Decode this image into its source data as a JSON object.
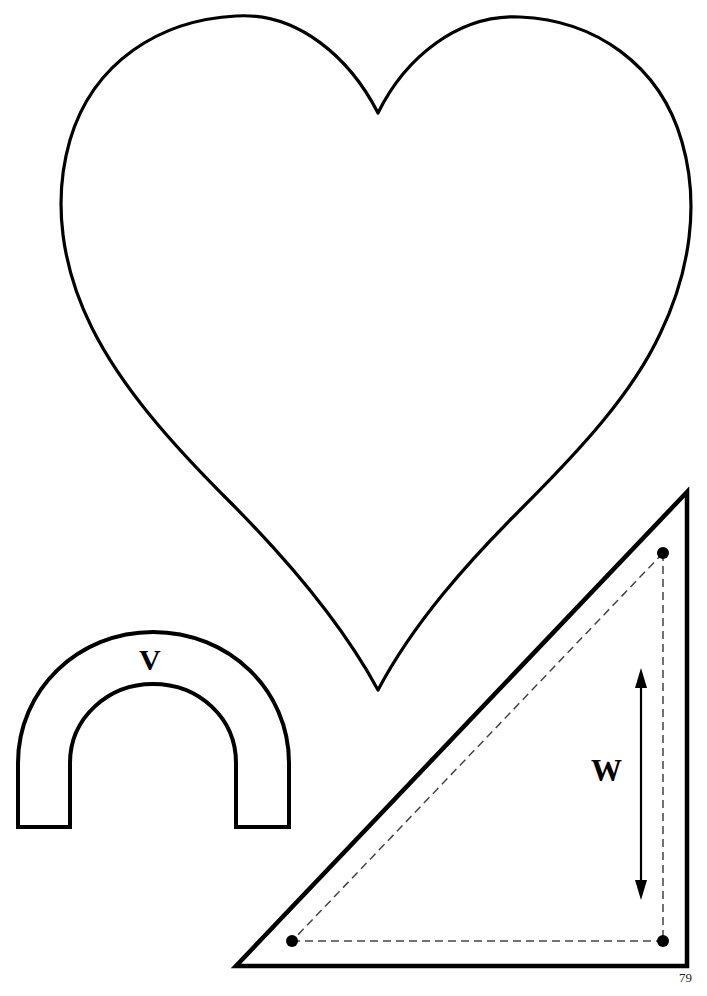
{
  "page": {
    "kind": "sewing-pattern-template-sheet",
    "background_color": "#ffffff",
    "ink_color": "#000000",
    "width": 707,
    "height": 996,
    "page_number": "79"
  },
  "shapes": {
    "heart": {
      "name": "heart-pattern-piece",
      "label": "",
      "stroke_color": "#000000",
      "stroke_width": 3.2,
      "fill": "none",
      "top_cleft": {
        "x": 378,
        "y": 113
      },
      "bottom_point": {
        "x": 378,
        "y": 690
      },
      "left_extent": {
        "x": 58,
        "y": 252
      },
      "right_extent": {
        "x": 697,
        "y": 268
      },
      "left_lobe_top": {
        "x": 237,
        "y": 15
      },
      "right_lobe_top": {
        "x": 520,
        "y": 17
      },
      "path": "M 378,113 C 352,60 300,12 237,15 C 150,19 60,90 58,230 C 56,330 120,430 220,520 C 290,583 350,650 378,690 C 406,650 470,580 545,512 C 645,420 699,340 697,250 C 695,110 608,18 520,17 C 452,16 402,62 378,113 Z"
    },
    "arch": {
      "name": "arch-pattern-piece",
      "label": "V",
      "stroke_color": "#000000",
      "stroke_width": 4.0,
      "fill": "none",
      "outer_left_x": 17,
      "outer_right_x": 290,
      "inner_left_x": 69,
      "inner_right_x": 237,
      "outer_top_y": 631,
      "inner_top_y": 683,
      "bottom_y": 827,
      "path": "M 17,827 L 17,764 C 17,690 79,631 153,631 C 228,631 290,690 290,764 L 290,827 L 237,827 L 237,764 C 237,718 200,683 153,683 C 107,683 69,718 69,764 L 69,827 Z"
    },
    "triangle": {
      "name": "triangle-pattern-piece",
      "label": "W",
      "stroke_color": "#000000",
      "stroke_width": 4.5,
      "fill": "none",
      "apex": {
        "x": 687,
        "y": 492
      },
      "bottom_left": {
        "x": 236,
        "y": 966
      },
      "bottom_right": {
        "x": 687,
        "y": 966
      },
      "path": "M 687,492 L 236,966 L 687,966 Z"
    }
  },
  "guides": {
    "name": "seam-allowance-guides",
    "stroke_color": "#333333",
    "stroke_width": 1.4,
    "dash_pattern": "8 5",
    "points": [
      {
        "name": "guide-point-top",
        "x": 663,
        "y": 553
      },
      {
        "name": "guide-point-bottom-left",
        "x": 292,
        "y": 941
      },
      {
        "name": "guide-point-bottom-right",
        "x": 663,
        "y": 941
      }
    ],
    "point_radius": 6,
    "segments": [
      {
        "name": "guide-hypotenuse",
        "x1": 663,
        "y1": 553,
        "x2": 292,
        "y2": 941
      },
      {
        "name": "guide-baseline",
        "x1": 292,
        "y1": 941,
        "x2": 663,
        "y2": 941
      },
      {
        "name": "guide-vertical",
        "x1": 663,
        "y1": 553,
        "x2": 663,
        "y2": 941
      }
    ]
  },
  "dimension_arrow": {
    "name": "width-dimension-arrow",
    "label": "W",
    "orientation": "vertical",
    "double_headed": true,
    "x": 641,
    "y_top": 672,
    "y_bottom": 896,
    "stroke_color": "#000000",
    "stroke_width": 2.2
  },
  "labels": {
    "arch_label": "V",
    "triangle_label": "W",
    "page_number": "79"
  }
}
